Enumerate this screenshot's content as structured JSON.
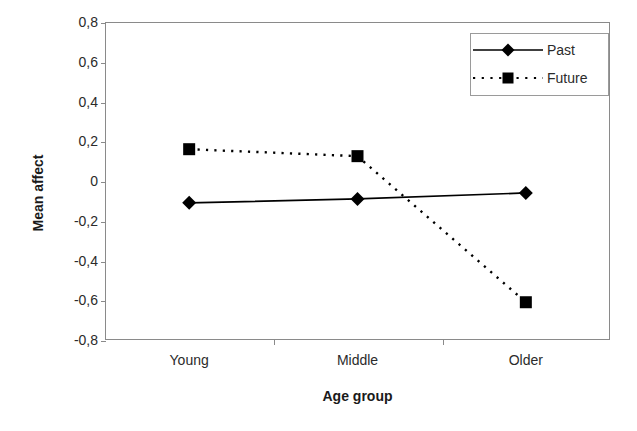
{
  "chart_data": {
    "type": "line",
    "title": "",
    "subtitle": "",
    "xlabel": "Age group",
    "ylabel": "Mean affect",
    "categories": [
      "Young",
      "Middle",
      "Older"
    ],
    "series": [
      {
        "name": "Past",
        "values": [
          -0.11,
          -0.09,
          -0.06
        ],
        "line_style": "solid",
        "marker": "diamond",
        "color": "#000000"
      },
      {
        "name": "Future",
        "values": [
          0.16,
          0.125,
          -0.61
        ],
        "line_style": "dotted",
        "marker": "square",
        "color": "#000000"
      }
    ],
    "ylim": [
      -0.8,
      0.8
    ],
    "yticks": [
      0.8,
      0.6,
      0.4,
      0.2,
      0,
      -0.2,
      -0.4,
      -0.6,
      -0.8
    ],
    "ytick_labels": [
      "0,8",
      "0,6",
      "0,4",
      "0,2",
      "0",
      "-0,2",
      "-0,4",
      "-0,6",
      "-0,8"
    ],
    "grid": false,
    "legend_position": "top-right",
    "decimal_separator": ",",
    "frame": true,
    "background": "#ffffff",
    "axis_color": "#8a8a8a",
    "text_color": "#2b2b2b"
  },
  "legend": {
    "entries": [
      {
        "label": "Past",
        "marker": "diamond-marker",
        "line": "solid-line"
      },
      {
        "label": "Future",
        "marker": "square-marker",
        "line": "dotted-line"
      }
    ]
  }
}
